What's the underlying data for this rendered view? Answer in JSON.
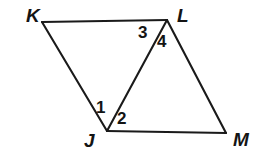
{
  "figure": {
    "name": "quadrilateral-klmj-with-diagonal",
    "background_color": "#ffffff",
    "stroke_color": "#1a1a1a",
    "label_color": "#141414",
    "width": 270,
    "height": 156,
    "vertices": [
      {
        "id": "K",
        "label": "K",
        "x": 42,
        "y": 22,
        "label_x": 26,
        "label_y": 6
      },
      {
        "id": "L",
        "label": "L",
        "x": 167,
        "y": 20,
        "label_x": 177,
        "label_y": 6
      },
      {
        "id": "J",
        "label": "J",
        "x": 107,
        "y": 131,
        "label_x": 84,
        "label_y": 131
      },
      {
        "id": "M",
        "label": "M",
        "x": 226,
        "y": 133,
        "label_x": 233,
        "label_y": 130
      }
    ],
    "segments": [
      {
        "id": "KL",
        "from": "K",
        "to": "L"
      },
      {
        "id": "KJ",
        "from": "K",
        "to": "J"
      },
      {
        "id": "JL",
        "from": "J",
        "to": "L"
      },
      {
        "id": "LM",
        "from": "L",
        "to": "M"
      },
      {
        "id": "JM",
        "from": "J",
        "to": "M"
      }
    ],
    "angle_labels": [
      {
        "id": "angle-1",
        "label": "1",
        "x": 96,
        "y": 99,
        "at_vertex": "J"
      },
      {
        "id": "angle-2",
        "label": "2",
        "x": 117,
        "y": 110,
        "at_vertex": "J"
      },
      {
        "id": "angle-3",
        "label": "3",
        "x": 138,
        "y": 24,
        "at_vertex": "L"
      },
      {
        "id": "angle-4",
        "label": "4",
        "x": 157,
        "y": 33,
        "at_vertex": "L"
      }
    ]
  }
}
